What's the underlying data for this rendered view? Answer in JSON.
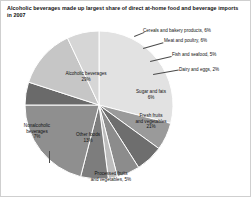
{
  "chart_data": {
    "type": "pie",
    "title": "Alcoholic beverages made up largest share of direct at-home food and beverage imports in 2007",
    "xlabel": "",
    "ylabel": "",
    "unit": "%",
    "legend": "none",
    "grid": false,
    "categories": [
      "Alcoholic beverages",
      "Cereals and bakery products",
      "Meat and poultry",
      "Fish and seafood",
      "Dairy and eggs",
      "Sugar and fats",
      "Fresh fruits and vegetables",
      "Processed fruits and vegetables",
      "Other foods",
      "Nonalcoholic beverages"
    ],
    "values": [
      29,
      6,
      6,
      5,
      2,
      6,
      21,
      5,
      13,
      7
    ],
    "slices": [
      {
        "label": "Alcoholic beverages",
        "value": 29,
        "value_text": "29%",
        "color": "#e2e2e2",
        "label_position": "inside"
      },
      {
        "label": "Cereals and bakery products",
        "value": 6,
        "value_text": "6%",
        "color": "#9a9a9a",
        "label_position": "outside"
      },
      {
        "label": "Meat and poultry",
        "value": 6,
        "value_text": "6%",
        "color": "#6e6e6e",
        "label_position": "outside"
      },
      {
        "label": "Fish and seafood",
        "value": 5,
        "value_text": "5%",
        "color": "#8c8c8c",
        "label_position": "outside"
      },
      {
        "label": "Dairy and eggs",
        "value": 2,
        "value_text": "2%",
        "color": "#bdbdbd",
        "label_position": "outside"
      },
      {
        "label": "Sugar and fats",
        "value": 6,
        "value_text": "6%",
        "color": "#7d7d7d",
        "label_position": "inside"
      },
      {
        "label": "Fresh fruits and vegetables",
        "value": 21,
        "value_text": "21%",
        "color": "#8f8f8f",
        "label_position": "inside"
      },
      {
        "label": "Processed fruits and vegetables",
        "value": 5,
        "value_text": "5%",
        "color": "#6a6a6a",
        "label_position": "outside"
      },
      {
        "label": "Other foods",
        "value": 13,
        "value_text": "13%",
        "color": "#c6c6c6",
        "label_position": "inside"
      },
      {
        "label": "Nonalcoholic beverages",
        "value": 7,
        "value_text": "7%",
        "color": "#d6d6d6",
        "label_position": "outside"
      }
    ]
  },
  "labels": {
    "cereals": "Cereals and bakery products, 6%",
    "meat": "Meat and poultry, 6%",
    "fish": "Fish and seafood, 5%",
    "dairy": "Dairy and eggs, 2%",
    "sugar_name": "Sugar and fats",
    "sugar_value": "6%",
    "fresh_name_1": "Fresh fruits",
    "fresh_name_2": "and vegetables",
    "fresh_value": "21%",
    "alcoholic_name": "Alcoholic beverages",
    "alcoholic_value": "29%",
    "nonalc_name_1": "Nonalcoholic",
    "nonalc_name_2": "beverages",
    "nonalc_value": "7%",
    "other_name": "Other foods",
    "other_value": "13%",
    "processed_name_1": "Processed fruits",
    "processed_name_2": "and vegetables, 5%"
  }
}
